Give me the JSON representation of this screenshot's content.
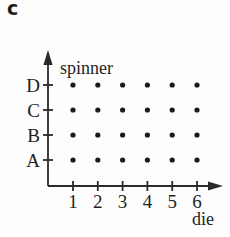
{
  "label": "c",
  "chart_data": {
    "type": "scatter",
    "title": "",
    "x_axis_label": "die",
    "y_axis_label": "spinner",
    "x_categories": [
      "1",
      "2",
      "3",
      "4",
      "5",
      "6"
    ],
    "y_categories": [
      "A",
      "B",
      "C",
      "D"
    ],
    "points": [
      {
        "die": "1",
        "spinner": "A"
      },
      {
        "die": "2",
        "spinner": "A"
      },
      {
        "die": "3",
        "spinner": "A"
      },
      {
        "die": "4",
        "spinner": "A"
      },
      {
        "die": "5",
        "spinner": "A"
      },
      {
        "die": "6",
        "spinner": "A"
      },
      {
        "die": "1",
        "spinner": "B"
      },
      {
        "die": "2",
        "spinner": "B"
      },
      {
        "die": "3",
        "spinner": "B"
      },
      {
        "die": "4",
        "spinner": "B"
      },
      {
        "die": "5",
        "spinner": "B"
      },
      {
        "die": "6",
        "spinner": "B"
      },
      {
        "die": "1",
        "spinner": "C"
      },
      {
        "die": "2",
        "spinner": "C"
      },
      {
        "die": "3",
        "spinner": "C"
      },
      {
        "die": "4",
        "spinner": "C"
      },
      {
        "die": "5",
        "spinner": "C"
      },
      {
        "die": "6",
        "spinner": "C"
      },
      {
        "die": "1",
        "spinner": "D"
      },
      {
        "die": "2",
        "spinner": "D"
      },
      {
        "die": "3",
        "spinner": "D"
      },
      {
        "die": "4",
        "spinner": "D"
      },
      {
        "die": "5",
        "spinner": "D"
      },
      {
        "die": "6",
        "spinner": "D"
      }
    ],
    "grid": false,
    "legend": false,
    "axis_color": "#2a2a2a",
    "dot_color": "#1b1b1b",
    "text_color": "#1f1f1f"
  }
}
